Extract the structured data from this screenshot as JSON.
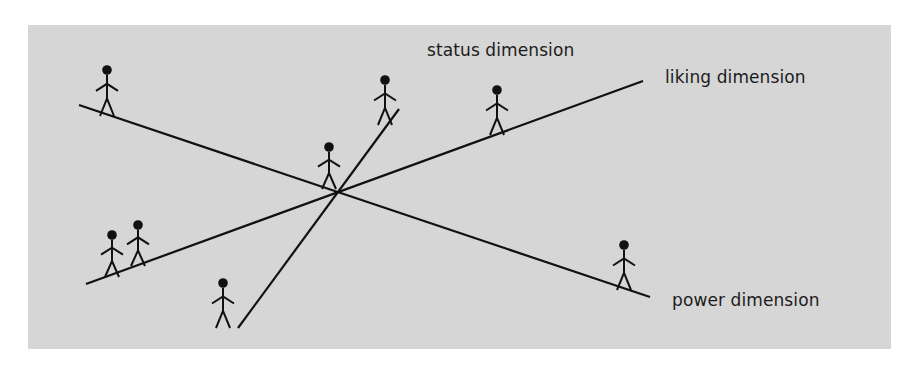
{
  "diagram": {
    "title": "",
    "background_color": "#d6d6d6",
    "page_color": "#ffffff",
    "line_color": "#111111",
    "panel": {
      "x": 28,
      "y": 25,
      "width": 863,
      "height": 324
    },
    "intersection": {
      "x": 338,
      "y": 193
    },
    "axes": [
      {
        "id": "power",
        "label": "power dimension",
        "start": {
          "x": 79,
          "y": 105
        },
        "end": {
          "x": 650,
          "y": 297
        },
        "label_pos": {
          "x": 672,
          "y": 290
        }
      },
      {
        "id": "liking",
        "label": "liking dimension",
        "start": {
          "x": 86,
          "y": 284
        },
        "end": {
          "x": 643,
          "y": 81
        },
        "label_pos": {
          "x": 665,
          "y": 67
        }
      },
      {
        "id": "status",
        "label": "status dimension",
        "start": {
          "x": 238,
          "y": 328
        },
        "end": {
          "x": 399,
          "y": 109
        },
        "label_pos": {
          "x": 427,
          "y": 40
        }
      }
    ],
    "figures": [
      {
        "id": "figure-power-top-left",
        "axis": "power",
        "head": {
          "x": 107,
          "y": 70
        },
        "feet_y": 116
      },
      {
        "id": "figure-status-top",
        "axis": "status",
        "head": {
          "x": 385,
          "y": 80
        },
        "feet_y": 125
      },
      {
        "id": "figure-liking-top-right",
        "axis": "liking",
        "head": {
          "x": 497,
          "y": 90
        },
        "feet_y": 135
      },
      {
        "id": "figure-center",
        "axis": "power",
        "head": {
          "x": 329,
          "y": 147
        },
        "feet_y": 189
      },
      {
        "id": "figure-liking-bottom-left-1",
        "axis": "liking",
        "head": {
          "x": 112,
          "y": 235
        },
        "feet_y": 277
      },
      {
        "id": "figure-liking-bottom-left-2",
        "axis": "liking",
        "head": {
          "x": 138,
          "y": 225
        },
        "feet_y": 266
      },
      {
        "id": "figure-status-bottom",
        "axis": "status",
        "head": {
          "x": 223,
          "y": 283
        },
        "feet_y": 328
      },
      {
        "id": "figure-power-bottom-right",
        "axis": "power",
        "head": {
          "x": 624,
          "y": 245
        },
        "feet_y": 290
      }
    ]
  }
}
